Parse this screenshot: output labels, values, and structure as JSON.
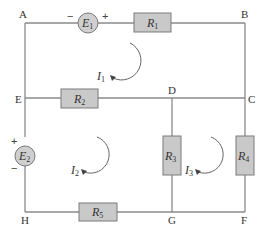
{
  "nodes": {
    "A": "A",
    "B": "B",
    "C": "C",
    "D": "D",
    "E": "E",
    "F": "F",
    "G": "G",
    "H": "H"
  },
  "resistors": [
    {
      "name": "R",
      "sub": "1"
    },
    {
      "name": "R",
      "sub": "2"
    },
    {
      "name": "R",
      "sub": "3"
    },
    {
      "name": "R",
      "sub": "4"
    },
    {
      "name": "R",
      "sub": "5"
    }
  ],
  "sources": [
    {
      "name": "E",
      "sub": "1",
      "neg": "−",
      "pos": "+"
    },
    {
      "name": "E",
      "sub": "2",
      "neg": "−",
      "pos": "+"
    }
  ],
  "loops": [
    {
      "name": "I",
      "sub": "1"
    },
    {
      "name": "I",
      "sub": "2"
    },
    {
      "name": "I",
      "sub": "3"
    }
  ]
}
